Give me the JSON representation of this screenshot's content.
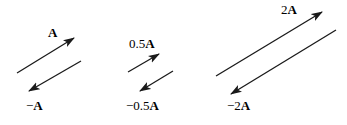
{
  "figure": {
    "background_color": "#ffffff",
    "stroke_color": "#1a1a1a",
    "width": 347,
    "height": 125,
    "groups": [
      {
        "name": "group-unit",
        "vectors": [
          {
            "name": "vector-a",
            "label_prefix": "",
            "label_symbol": "A",
            "label_x": 48,
            "label_y": 26,
            "x1": 17,
            "y1": 73,
            "x2": 74,
            "y2": 38,
            "direction": "up-right"
          },
          {
            "name": "vector-negative-a",
            "label_prefix": "−",
            "label_symbol": "A",
            "label_x": 26,
            "label_y": 99,
            "x1": 81,
            "y1": 61,
            "x2": 29,
            "y2": 91,
            "direction": "down-left"
          }
        ]
      },
      {
        "name": "group-half",
        "vectors": [
          {
            "name": "vector-half-a",
            "label_prefix": "0.5",
            "label_symbol": "A",
            "label_x": 129,
            "label_y": 37,
            "x1": 128,
            "y1": 72,
            "x2": 159,
            "y2": 54,
            "direction": "up-right"
          },
          {
            "name": "vector-negative-half-a",
            "label_prefix": "−0.5",
            "label_symbol": "A",
            "label_x": 126,
            "label_y": 99,
            "x1": 173,
            "y1": 71,
            "x2": 140,
            "y2": 91,
            "direction": "down-left"
          }
        ]
      },
      {
        "name": "group-double",
        "vectors": [
          {
            "name": "vector-two-a",
            "label_prefix": "2",
            "label_symbol": "A",
            "label_x": 281,
            "label_y": 3,
            "x1": 216,
            "y1": 76,
            "x2": 322,
            "y2": 12,
            "direction": "up-right"
          },
          {
            "name": "vector-negative-two-a",
            "label_prefix": "−2",
            "label_symbol": "A",
            "label_x": 227,
            "label_y": 99,
            "x1": 336,
            "y1": 30,
            "x2": 231,
            "y2": 94,
            "direction": "down-left"
          }
        ]
      }
    ]
  }
}
